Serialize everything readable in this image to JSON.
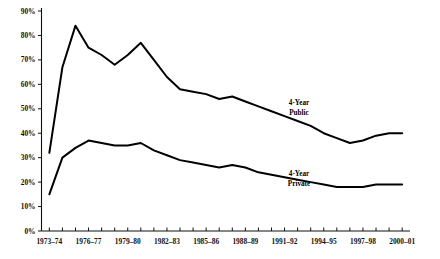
{
  "chart_data": {
    "type": "line",
    "title": "",
    "subtitle": "",
    "xlabel": "",
    "ylabel": "",
    "ylim": [
      0,
      90
    ],
    "yticks": [
      0,
      10,
      20,
      30,
      40,
      50,
      60,
      70,
      80,
      90
    ],
    "ytick_labels": [
      "0%",
      "10%",
      "20%",
      "30%",
      "40%",
      "50%",
      "60%",
      "70%",
      "80%",
      "90%"
    ],
    "x": [
      "1973-74",
      "1974-75",
      "1975-76",
      "1976-77",
      "1977-78",
      "1978-79",
      "1979-80",
      "1980-81",
      "1981-82",
      "1982-83",
      "1983-84",
      "1984-85",
      "1985-86",
      "1986-87",
      "1987-88",
      "1988-89",
      "1989-90",
      "1990-91",
      "1991-92",
      "1992-93",
      "1993-94",
      "1994-95",
      "1995-96",
      "1996-97",
      "1997-98",
      "1998-99",
      "1999-00",
      "2000-01"
    ],
    "xtick_labels": [
      "1973–74",
      "1976–77",
      "1979–80",
      "1982–83",
      "1985–86",
      "1988–89",
      "1991–92",
      "1994–95",
      "1997–98",
      "2000–01"
    ],
    "xtick_indices": [
      0,
      3,
      6,
      9,
      12,
      15,
      18,
      21,
      24,
      27
    ],
    "grid": false,
    "legend_position": "inline-annotation",
    "series": [
      {
        "name": "4-Year Public",
        "label_line1": "4-Year",
        "label_line2": "Public",
        "color": "#000000",
        "values": [
          32,
          67,
          84,
          75,
          72,
          68,
          72,
          77,
          70,
          63,
          58,
          57,
          56,
          54,
          55,
          53,
          51,
          49,
          47,
          45,
          43,
          40,
          38,
          36,
          37,
          39,
          40,
          40
        ]
      },
      {
        "name": "4-Year Private",
        "label_line1": "4-Year",
        "label_line2": "Private",
        "color": "#000000",
        "values": [
          15,
          30,
          34,
          37,
          36,
          35,
          35,
          36,
          33,
          31,
          29,
          28,
          27,
          26,
          27,
          26,
          24,
          23,
          22,
          21,
          20,
          19,
          18,
          18,
          18,
          19,
          19,
          19
        ]
      }
    ]
  },
  "axes": {
    "y_axis_name": "percent-axis",
    "x_axis_name": "academic-year-axis"
  }
}
